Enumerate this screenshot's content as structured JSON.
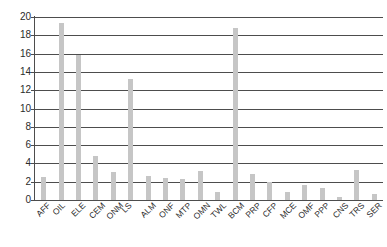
{
  "chart_data": {
    "type": "bar",
    "title": "",
    "subtitle": "",
    "xlabel": "",
    "ylabel": "",
    "ylim": [
      0,
      20
    ],
    "xlim": null,
    "grid": true,
    "grid_axis": "y",
    "legend": false,
    "legend_position": "none",
    "bar_color": "#c6c6c6",
    "axis_color": "#4d4d4d",
    "text_color": "#2b2b2b",
    "background": "#ffffff",
    "y_ticks": [
      0,
      2,
      4,
      6,
      8,
      10,
      12,
      14,
      16,
      18,
      20
    ],
    "y_tick_labels": [
      "0",
      "2",
      "4",
      "6",
      "8",
      "10",
      "12",
      "14",
      "16",
      "18",
      "20"
    ],
    "categories": [
      "AFF",
      "OIL",
      "ELE",
      "CEM",
      "ONM",
      "LS",
      "ALM",
      "ONF",
      "MTP",
      "OMN",
      "TWL",
      "BCM",
      "PRP",
      "CFP",
      "MCE",
      "OMF",
      "PPP",
      "CNS",
      "TRS",
      "SER"
    ],
    "values": [
      2.5,
      19.4,
      15.8,
      4.8,
      3.1,
      13.2,
      2.6,
      2.4,
      2.3,
      3.2,
      0.9,
      18.8,
      2.8,
      2.0,
      0.9,
      1.6,
      1.3,
      0.3,
      3.3,
      0.7
    ]
  }
}
